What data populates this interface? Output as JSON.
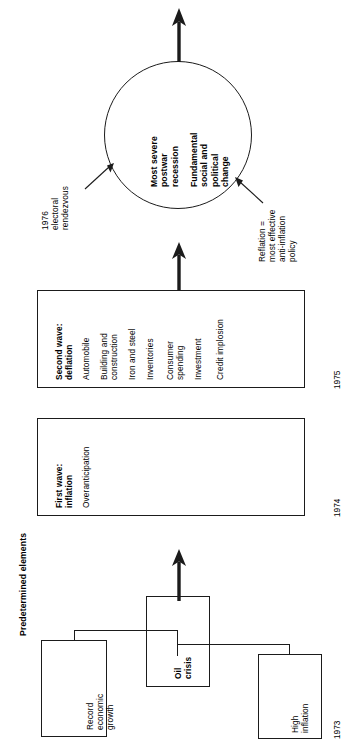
{
  "diagram": {
    "header": "Predetermined elements",
    "orientation": "rotated-90-ccw",
    "timeline": [
      "1973",
      "1974",
      "1975"
    ],
    "stage1": {
      "boxes": [
        {
          "id": "record-economic-growth",
          "label": "Record\neconomic\ngrowth"
        },
        {
          "id": "oil-crisis",
          "label": "Oil crisis"
        },
        {
          "id": "high-inflation",
          "label": "High\ninflation"
        }
      ],
      "year": "1973"
    },
    "stage2": {
      "title": "First wave:\ninflation",
      "items": [
        "Overanticipation"
      ],
      "year": "1974"
    },
    "stage3": {
      "title": "Second wave:\ndeflation",
      "items": [
        "Automobile",
        "Building and\nconstruction",
        "Iron and steel",
        "Inventories",
        "Consumer\nspending",
        "Investment",
        "Credit implosion"
      ],
      "year": "1975"
    },
    "outcome": {
      "line1": "Most severe\npostwar\nrecession",
      "line2": "Fundamental\nsocial and\npolitical\nchange"
    },
    "annotations": [
      {
        "id": "electoral-rendezvous",
        "text": "1976\nelectoral\nrendezvous"
      },
      {
        "id": "reflation-policy",
        "text": "Reflation =\nmost effective\nanti-inflation\npolicy"
      }
    ],
    "colors": {
      "ink": "#1b1b1b",
      "paper": "#ffffff"
    }
  }
}
